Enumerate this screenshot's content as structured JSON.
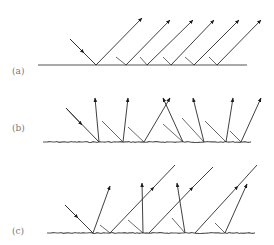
{
  "figure": {
    "panels": [
      {
        "label": "(a)",
        "description": "specular reflection",
        "label_pos": [
          12,
          74
        ],
        "surface": {
          "x1": 38,
          "x2": 247,
          "y": 65,
          "rough": false
        },
        "incident": {
          "from": [
            70,
            39
          ],
          "to": [
            96,
            65
          ],
          "head": [
            84,
            53
          ]
        },
        "stubs": [
          [
            [
              116,
              57
            ],
            [
              126,
              65
            ]
          ],
          [
            [
              140,
              57
            ],
            [
              147,
              65
            ]
          ],
          [
            [
              163,
              57
            ],
            [
              171,
              65
            ]
          ],
          [
            [
              185,
              57
            ],
            [
              194,
              65
            ]
          ],
          [
            [
              209,
              57
            ],
            [
              217,
              65
            ]
          ]
        ],
        "reflected": [
          {
            "from": [
              96,
              65
            ],
            "tip": [
              142,
              18
            ]
          },
          {
            "from": [
              126,
              65
            ],
            "tip": [
              170,
              20
            ]
          },
          {
            "from": [
              147,
              65
            ],
            "tip": [
              193,
              20
            ]
          },
          {
            "from": [
              171,
              65
            ],
            "tip": [
              214,
              20
            ]
          },
          {
            "from": [
              194,
              65
            ],
            "tip": [
              239,
              20
            ]
          },
          {
            "from": [
              217,
              65
            ],
            "tip": [
              261,
              20
            ]
          }
        ]
      },
      {
        "label": "(b)",
        "description": "diffuse reflection",
        "label_pos": [
          12,
          131
        ],
        "surface": {
          "x1": 43,
          "x2": 252,
          "y": 142,
          "rough": true
        },
        "incident": {
          "from": [
            66,
            108
          ],
          "to": [
            99,
            142
          ],
          "head": [
            82,
            125
          ]
        },
        "stubs": [
          [
            [
              102,
              121
            ],
            [
              123,
              142
            ]
          ],
          [
            [
              128,
              127
            ],
            [
              144,
              142
            ]
          ],
          [
            [
              163,
              124
            ],
            [
              183,
              142
            ]
          ],
          [
            [
              182,
              118
            ],
            [
              204,
              142
            ]
          ],
          [
            [
              205,
              121
            ],
            [
              226,
              142
            ]
          ],
          [
            [
              230,
              131
            ],
            [
              241,
              142
            ]
          ]
        ],
        "reflected": [
          {
            "from": [
              99,
              142
            ],
            "tip": [
              95,
              98
            ]
          },
          {
            "from": [
              123,
              142
            ],
            "tip": [
              128,
              98
            ]
          },
          {
            "from": [
              144,
              142
            ],
            "tip": [
              170,
              98
            ]
          },
          {
            "from": [
              183,
              142
            ],
            "tip": [
              163,
              98
            ]
          },
          {
            "from": [
              204,
              142
            ],
            "tip": [
              193,
              98
            ]
          },
          {
            "from": [
              226,
              142
            ],
            "tip": [
              233,
              98
            ]
          },
          {
            "from": [
              241,
              142
            ],
            "tip": [
              261,
              98
            ]
          }
        ]
      },
      {
        "label": "(c)",
        "description": "mixed reflection",
        "label_pos": [
          12,
          234
        ],
        "surface": {
          "x1": 47,
          "x2": 255,
          "y": 233,
          "rough": true
        },
        "incident": {
          "from": [
            65,
            205
          ],
          "to": [
            93,
            233
          ],
          "head": [
            78,
            218
          ]
        },
        "stubs": [
          [
            [
              100,
              225
            ],
            [
              110,
              233
            ]
          ],
          [
            [
              128,
              220
            ],
            [
              143,
              233
            ]
          ],
          [
            [
              172,
              218
            ],
            [
              185,
              233
            ]
          ],
          [
            [
              215,
              223
            ],
            [
              225,
              233
            ]
          ]
        ],
        "reflected": [
          {
            "from": [
              93,
              233
            ],
            "tip": [
              110,
              186
            ]
          },
          {
            "from": [
              110,
              233
            ],
            "tip": [
              154,
              187
            ],
            "extend": [
              175,
              165
            ]
          },
          {
            "from": [
              143,
              233
            ],
            "tip": [
              142,
              183
            ]
          },
          {
            "from": [
              149,
              233
            ],
            "tip": [
              193,
              187
            ],
            "extend": [
              213,
              167
            ]
          },
          {
            "from": [
              185,
              233
            ],
            "tip": [
              177,
              183
            ]
          },
          {
            "from": [
              195,
              233
            ],
            "tip": [
              238,
              186
            ],
            "extend": [
              257,
              165
            ]
          },
          {
            "from": [
              225,
              233
            ],
            "tip": [
              247,
              184
            ]
          }
        ]
      }
    ]
  }
}
